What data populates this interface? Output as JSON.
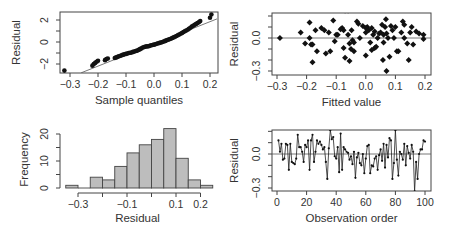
{
  "chart_data": [
    {
      "type": "scatter",
      "panel": "normal-probability-plot",
      "title": "",
      "xlabel": "Sample quantiles",
      "ylabel": "Residual",
      "xlim": [
        -0.34,
        0.225
      ],
      "ylim": [
        -2.8,
        2.75
      ],
      "x_ticks": [
        "-0.3",
        "-0.2",
        "-0.1",
        "0.0",
        "0.1",
        "0.2"
      ],
      "y_ticks": [
        "-2",
        "0",
        "2"
      ],
      "reference_line": {
        "x1": -0.26,
        "y1": -2.8,
        "x2": 0.225,
        "y2": 2.1
      },
      "points": [
        [
          -0.32,
          -2.6
        ],
        [
          -0.22,
          -2.15
        ],
        [
          -0.215,
          -2.0
        ],
        [
          -0.21,
          -1.9
        ],
        [
          -0.205,
          -1.8
        ],
        [
          -0.2,
          -1.7
        ],
        [
          -0.175,
          -1.65
        ],
        [
          -0.17,
          -1.55
        ],
        [
          -0.165,
          -1.5
        ],
        [
          -0.14,
          -1.45
        ],
        [
          -0.135,
          -1.4
        ],
        [
          -0.13,
          -1.35
        ],
        [
          -0.125,
          -1.3
        ],
        [
          -0.12,
          -1.25
        ],
        [
          -0.115,
          -1.2
        ],
        [
          -0.11,
          -1.15
        ],
        [
          -0.105,
          -1.12
        ],
        [
          -0.1,
          -1.08
        ],
        [
          -0.095,
          -1.05
        ],
        [
          -0.09,
          -1.0
        ],
        [
          -0.085,
          -0.98
        ],
        [
          -0.08,
          -0.95
        ],
        [
          -0.075,
          -0.9
        ],
        [
          -0.07,
          -0.86
        ],
        [
          -0.065,
          -0.82
        ],
        [
          -0.06,
          -0.78
        ],
        [
          -0.055,
          -0.72
        ],
        [
          -0.05,
          -0.65
        ],
        [
          -0.045,
          -0.58
        ],
        [
          -0.04,
          -0.5
        ],
        [
          -0.035,
          -0.45
        ],
        [
          -0.03,
          -0.42
        ],
        [
          -0.025,
          -0.4
        ],
        [
          -0.02,
          -0.38
        ],
        [
          -0.015,
          -0.35
        ],
        [
          -0.01,
          -0.3
        ],
        [
          -0.005,
          -0.27
        ],
        [
          0.0,
          -0.24
        ],
        [
          0.005,
          -0.2
        ],
        [
          0.01,
          -0.16
        ],
        [
          0.015,
          -0.12
        ],
        [
          0.02,
          -0.08
        ],
        [
          0.025,
          -0.04
        ],
        [
          0.03,
          0.0
        ],
        [
          0.035,
          0.05
        ],
        [
          0.04,
          0.1
        ],
        [
          0.045,
          0.15
        ],
        [
          0.05,
          0.2
        ],
        [
          0.055,
          0.25
        ],
        [
          0.06,
          0.3
        ],
        [
          0.065,
          0.36
        ],
        [
          0.07,
          0.42
        ],
        [
          0.075,
          0.48
        ],
        [
          0.08,
          0.55
        ],
        [
          0.085,
          0.62
        ],
        [
          0.09,
          0.68
        ],
        [
          0.095,
          0.75
        ],
        [
          0.1,
          0.82
        ],
        [
          0.105,
          0.9
        ],
        [
          0.11,
          0.98
        ],
        [
          0.115,
          1.05
        ],
        [
          0.12,
          1.12
        ],
        [
          0.125,
          1.2
        ],
        [
          0.13,
          1.3
        ],
        [
          0.135,
          1.4
        ],
        [
          0.14,
          1.48
        ],
        [
          0.145,
          1.56
        ],
        [
          0.15,
          1.64
        ],
        [
          0.155,
          1.72
        ],
        [
          0.16,
          1.8
        ],
        [
          0.165,
          1.9
        ],
        [
          0.2,
          2.2
        ],
        [
          0.205,
          2.5
        ]
      ]
    },
    {
      "type": "scatter",
      "panel": "residuals-vs-fitted",
      "title": "",
      "xlabel": "Fitted value",
      "ylabel": "Residual",
      "xlim": [
        -0.32,
        0.22
      ],
      "ylim": [
        -0.35,
        0.22
      ],
      "x_ticks": [
        "-0.3",
        "-0.2",
        "-0.1",
        "0.0",
        "0.1",
        "0.2"
      ],
      "y_ticks": [
        "-0.3",
        "0.0"
      ],
      "reference_line": {
        "y": 0.0
      },
      "points": [
        [
          -0.29,
          0.0
        ],
        [
          -0.22,
          0.05
        ],
        [
          -0.205,
          -0.05
        ],
        [
          -0.19,
          0.14
        ],
        [
          -0.19,
          0.0
        ],
        [
          -0.185,
          -0.06
        ],
        [
          -0.18,
          -0.06
        ],
        [
          -0.18,
          -0.22
        ],
        [
          -0.17,
          0.07
        ],
        [
          -0.165,
          -0.12
        ],
        [
          -0.14,
          0.07
        ],
        [
          -0.135,
          -0.14
        ],
        [
          -0.125,
          0.05
        ],
        [
          -0.12,
          -0.12
        ],
        [
          -0.11,
          0.16
        ],
        [
          -0.1,
          0.03
        ],
        [
          -0.105,
          -0.03
        ],
        [
          -0.095,
          0.03
        ],
        [
          -0.08,
          0.09
        ],
        [
          -0.075,
          -0.09
        ],
        [
          -0.075,
          0.07
        ],
        [
          -0.07,
          0.25
        ],
        [
          -0.07,
          -0.18
        ],
        [
          -0.06,
          0.25
        ],
        [
          -0.06,
          0.03
        ],
        [
          -0.055,
          -0.05
        ],
        [
          -0.055,
          -0.21
        ],
        [
          -0.05,
          -0.1
        ],
        [
          -0.048,
          0.07
        ],
        [
          -0.045,
          -0.02
        ],
        [
          -0.04,
          -0.12
        ],
        [
          -0.03,
          0.15
        ],
        [
          -0.025,
          0.13
        ],
        [
          -0.02,
          0.0
        ],
        [
          -0.01,
          0.11
        ],
        [
          0.0,
          0.09
        ],
        [
          0.0,
          0.05
        ],
        [
          0.0,
          -0.16
        ],
        [
          0.005,
          0.1
        ],
        [
          0.01,
          0.07
        ],
        [
          0.015,
          -0.04
        ],
        [
          0.02,
          0.09
        ],
        [
          0.025,
          0.03
        ],
        [
          0.03,
          -0.09
        ],
        [
          0.035,
          -0.08
        ],
        [
          0.04,
          0.0
        ],
        [
          0.045,
          0.04
        ],
        [
          0.05,
          0.05
        ],
        [
          0.055,
          0.12
        ],
        [
          0.058,
          -0.2
        ],
        [
          0.06,
          0.03
        ],
        [
          0.065,
          0.1
        ],
        [
          0.068,
          0.17
        ],
        [
          0.07,
          -0.3
        ],
        [
          0.075,
          0.0
        ],
        [
          0.08,
          -0.17
        ],
        [
          0.085,
          0.11
        ],
        [
          0.09,
          0.07
        ],
        [
          0.095,
          0.0
        ],
        [
          0.1,
          0.1
        ],
        [
          0.105,
          -0.12
        ],
        [
          0.11,
          -0.12
        ],
        [
          0.12,
          0.05
        ],
        [
          0.125,
          0.15
        ],
        [
          0.13,
          0.12
        ],
        [
          0.13,
          0.0
        ],
        [
          0.14,
          -0.05
        ],
        [
          0.145,
          -0.2
        ],
        [
          0.15,
          0.05
        ],
        [
          0.155,
          0.1
        ],
        [
          0.16,
          -0.06
        ],
        [
          0.17,
          0.06
        ],
        [
          0.18,
          0.04
        ],
        [
          0.195,
          0.03
        ],
        [
          0.195,
          -0.01
        ],
        [
          0.02,
          -0.11
        ],
        [
          -0.15,
          0.09
        ],
        [
          0.06,
          -0.04
        ],
        [
          0.07,
          0.04
        ],
        [
          0.03,
          0.06
        ],
        [
          -0.085,
          0.08
        ],
        [
          -0.04,
          -0.04
        ]
      ]
    },
    {
      "type": "bar",
      "panel": "histogram-of-residuals",
      "title": "",
      "xlabel": "Residual",
      "ylabel": "Frequency",
      "ylim": [
        0,
        22
      ],
      "x_ticks": [
        "-0.3",
        "-0.1",
        "0.1",
        "0.2"
      ],
      "y_ticks": [
        "0",
        "10",
        "20"
      ],
      "bin_width": 0.05,
      "categories": [
        "-0.35 to -0.30",
        "-0.30 to -0.25",
        "-0.25 to -0.20",
        "-0.20 to -0.15",
        "-0.15 to -0.10",
        "-0.10 to -0.05",
        "-0.05 to 0.00",
        "0.00 to 0.05",
        "0.05 to 0.10",
        "0.10 to 0.15",
        "0.15 to 0.20",
        "0.20 to 0.25"
      ],
      "bin_edges": [
        -0.35,
        -0.3,
        -0.25,
        -0.2,
        -0.15,
        -0.1,
        -0.05,
        0.0,
        0.05,
        0.1,
        0.15,
        0.2,
        0.25
      ],
      "values": [
        1,
        0,
        4,
        3,
        8,
        13,
        16,
        18,
        22,
        11,
        3,
        1
      ]
    },
    {
      "type": "line",
      "panel": "residuals-vs-order",
      "title": "",
      "xlabel": "Observation order",
      "ylabel": "Residual",
      "xlim": [
        -3,
        104
      ],
      "ylim": [
        -0.35,
        0.22
      ],
      "x_ticks": [
        "0",
        "20",
        "40",
        "60",
        "80",
        "100"
      ],
      "y_ticks": [
        "-0.3",
        "0.0"
      ],
      "reference_line": {
        "y": 0.0
      },
      "x": [
        1,
        2,
        3,
        4,
        5,
        6,
        7,
        8,
        9,
        10,
        11,
        12,
        13,
        14,
        15,
        16,
        17,
        18,
        19,
        20,
        21,
        22,
        23,
        24,
        25,
        26,
        27,
        28,
        29,
        30,
        31,
        32,
        33,
        34,
        35,
        36,
        37,
        38,
        39,
        40,
        41,
        42,
        43,
        44,
        45,
        46,
        47,
        48,
        49,
        50,
        51,
        52,
        53,
        54,
        55,
        56,
        57,
        58,
        59,
        60,
        61,
        62,
        63,
        64,
        65,
        66,
        67,
        68,
        69,
        70,
        71,
        72,
        73,
        74,
        75,
        76,
        77,
        78,
        79,
        80,
        81,
        82,
        83,
        84,
        85,
        86,
        87,
        88,
        89,
        90,
        91,
        92,
        93,
        94,
        95,
        96,
        97,
        98,
        99,
        100
      ],
      "values": [
        0.12,
        0.02,
        0.09,
        -0.05,
        -0.04,
        0.09,
        0.08,
        -0.14,
        0.09,
        -0.07,
        -0.08,
        -0.09,
        -0.04,
        0.17,
        0.06,
        0.06,
        0.02,
        -0.07,
        0.08,
        0.06,
        0.12,
        -0.14,
        0.12,
        0.17,
        -0.07,
        0.02,
        0.12,
        0.09,
        0.11,
        0.08,
        0.04,
        0.06,
        -0.07,
        -0.22,
        0.05,
        0.21,
        0.13,
        0.15,
        -0.02,
        -0.04,
        0.06,
        -0.16,
        0.18,
        -0.14,
        0.06,
        0.04,
        0.02,
        0.01,
        -0.05,
        -0.02,
        -0.09,
        0.02,
        -0.21,
        -0.03,
        0.01,
        -0.08,
        -0.1,
        0.0,
        -0.17,
        -0.04,
        0.07,
        0.08,
        -0.17,
        -0.1,
        -0.11,
        -0.04,
        -0.02,
        -0.14,
        -0.01,
        0.04,
        -0.06,
        0.09,
        -0.12,
        0.08,
        -0.03,
        0.14,
        0.12,
        -0.22,
        -0.08,
        0.21,
        -0.05,
        -0.19,
        0.02,
        0.0,
        -0.05,
        0.09,
        -0.1,
        0.07,
        0.01,
        -0.04,
        0.08,
        0.02,
        -0.33,
        -0.07,
        -0.22,
        0.0,
        0.04,
        0.04,
        0.12,
        0.11
      ]
    }
  ]
}
